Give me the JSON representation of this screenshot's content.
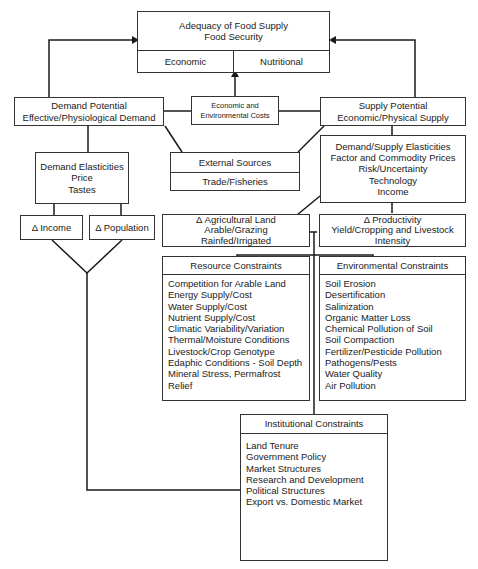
{
  "top": {
    "title_line1": "Adequacy of Food Supply",
    "title_line2": "Food Security",
    "left_cell": "Economic",
    "right_cell": "Nutritional"
  },
  "demand_potential": {
    "line1": "Demand Potential",
    "line2": "Effective/Physiological Demand"
  },
  "costs": {
    "line1": "Economic and",
    "line2": "Environmental Costs"
  },
  "supply_potential": {
    "line1": "Supply Potential",
    "line2": "Economic/Physical Supply"
  },
  "demand_elasticities": {
    "line1": "Demand Elasticities",
    "line2": "Price",
    "line3": "Tastes"
  },
  "external_sources": {
    "header": "External Sources",
    "sub": "Trade/Fisheries"
  },
  "supply_factors": {
    "lines": [
      "Demand/Supply Elasticities",
      "Factor and Commodity Prices",
      "Risk/Uncertainty",
      "Technology",
      "Income"
    ]
  },
  "income": {
    "label": "Δ Income"
  },
  "population": {
    "label": "Δ Population"
  },
  "agri_land": {
    "line1": "Δ Agricultural Land",
    "line2": "Arable/Grazing",
    "line3": "Rainfed/Irrigated"
  },
  "productivity": {
    "line1": "Δ Productivity",
    "line2": "Yield/Cropping and Livestock",
    "line3": "Intensity"
  },
  "resource_constraints": {
    "header": "Resource Constraints",
    "items": [
      "Competition for Arable Land",
      "Energy Supply/Cost",
      "Water Supply/Cost",
      "Nutrient Supply/Cost",
      "Climatic Variability/Variation",
      "Thermal/Moisture Conditions",
      "Livestock/Crop Genotype",
      "Edaphic Conditions - Soil Depth",
      "Mineral Stress, Permafrost",
      "Relief"
    ]
  },
  "environmental_constraints": {
    "header": "Environmental Constraints",
    "items": [
      "Soil Erosion",
      "Desertification",
      "Salinization",
      "Organic Matter Loss",
      "Chemical Pollution of Soil",
      "Soil Compaction",
      "Fertilizer/Pesticide Pollution",
      "Pathogens/Pests",
      "Water Quality",
      "Air Pollution"
    ]
  },
  "institutional_constraints": {
    "header": "Institutional Constraints",
    "items": [
      "Land Tenure",
      "Government Policy",
      "Market Structures",
      "Research and Development",
      "Political Structures",
      "Export vs. Domestic Market"
    ]
  }
}
